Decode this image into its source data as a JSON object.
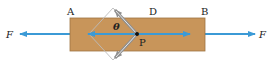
{
  "diagram": {
    "labels": {
      "A": "A",
      "D": "D",
      "B": "B",
      "P": "P",
      "theta": "θ",
      "force_left": "F",
      "force_right": "F"
    },
    "colors": {
      "bar_fill": "#C8955A",
      "bar_stroke": "#9E7442",
      "force_arrow": "#3B9AD6",
      "diamond_outline": "#BBBBBB",
      "component_arrow": "#8F8F8F",
      "point": "#111111"
    },
    "elements": {
      "bar": "rectangular rod between A and B",
      "section_plane": "oblique plane through P at angle θ",
      "forces": "equal and opposite tensile forces F at both ends"
    }
  }
}
